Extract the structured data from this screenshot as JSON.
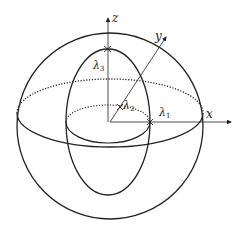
{
  "diagram": {
    "title": "",
    "axes": {
      "x_label": "x",
      "y_label": "y",
      "z_label": "z"
    },
    "eigen_labels": {
      "lambda1": "λ",
      "lambda1_sub": "1",
      "lambda2": "λ",
      "lambda2_sub": "2",
      "lambda3": "λ",
      "lambda3_sub": "3"
    },
    "colors": {
      "stroke": "#222222",
      "background": "#ffffff"
    }
  }
}
